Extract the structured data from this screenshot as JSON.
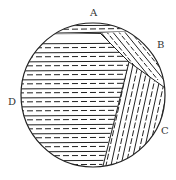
{
  "diagram": {
    "type": "circular-section-with-striated-regions",
    "labels": [
      {
        "id": "A",
        "text": "A",
        "x": 90,
        "y": 8
      },
      {
        "id": "B",
        "text": "B",
        "x": 157,
        "y": 40
      },
      {
        "id": "C",
        "text": "C",
        "x": 161,
        "y": 126
      },
      {
        "id": "D",
        "text": "D",
        "x": 8,
        "y": 97
      }
    ],
    "regions": [
      {
        "id": "A",
        "pattern": "horizontal dashed bands (top cap)"
      },
      {
        "id": "B",
        "pattern": "diagonal lines descending to the right"
      },
      {
        "id": "C",
        "pattern": "steep diagonal lines with dashes"
      },
      {
        "id": "D",
        "pattern": "horizontal lines with dashes (large left region)"
      }
    ],
    "colors": {
      "stroke": "#222222",
      "background": "#ffffff"
    }
  }
}
